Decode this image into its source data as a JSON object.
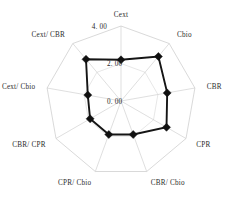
{
  "chart_data": {
    "type": "radar",
    "title": "",
    "subtitle": "",
    "xlabel": "",
    "ylabel": "",
    "grid": true,
    "legend": "none",
    "rlim": [
      0.0,
      4.0
    ],
    "r_ticks": [
      "0. 00",
      "2. 00",
      "4. 00"
    ],
    "r_tick_values": [
      0.0,
      2.0,
      4.0
    ],
    "categories": [
      "Cext",
      "Cbio",
      "CBR",
      "CPR",
      "CBR/ Cbio",
      "CPR/ Cbio",
      "CBR/ CPR",
      "Cext/ Cbio",
      "Cext/ CBR"
    ],
    "series": [
      {
        "name": "series-1",
        "color": "#101010",
        "values": [
          2.2,
          3.1,
          2.5,
          2.8,
          1.9,
          1.9,
          1.9,
          1.8,
          2.9
        ]
      }
    ]
  },
  "axes": {
    "labels": [
      {
        "text": "Cext",
        "angle_deg": 90
      },
      {
        "text": "Cbio",
        "angle_deg": 50
      },
      {
        "text": "CBR",
        "angle_deg": 10
      },
      {
        "text": "CPR",
        "angle_deg": -30
      },
      {
        "text": "CBR/ Cbio",
        "angle_deg": -70
      },
      {
        "text": "CPR/ Cbio",
        "angle_deg": -110
      },
      {
        "text": "CBR/ CPR",
        "angle_deg": -150
      },
      {
        "text": "Cext/ Cbio",
        "angle_deg": 170
      },
      {
        "text": "Cext/ CBR",
        "angle_deg": 130
      }
    ]
  },
  "ticks": {
    "outer": "4. 00",
    "middle": "2. 00",
    "inner": "0. 00"
  },
  "style": {
    "series_color": "#101010",
    "grid_color": "#c9c9c9",
    "background": "#ffffff",
    "text_color": "#2b2b2b"
  }
}
